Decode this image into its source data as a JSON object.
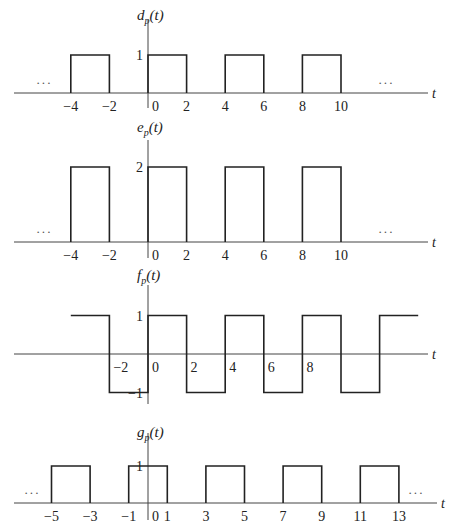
{
  "layout": {
    "origin_x": 148,
    "px_per_unit_x": 19.3
  },
  "plots": [
    {
      "id": "d",
      "ylabel_main": "d",
      "ylabel_sub": "p",
      "ylabel_arg": "(t)",
      "xlabel": "t",
      "axis_y": 93,
      "px_per_unit_y": 38,
      "yaxis_top": 20,
      "yaxis_bottom": 108,
      "xaxis_left": 14,
      "xaxis_right": 428,
      "label_y": 20,
      "ytick_labels": [
        {
          "value": 1,
          "text": "1"
        }
      ],
      "xtick_labels": [
        {
          "value": -4,
          "text": "−4"
        },
        {
          "value": -2,
          "text": "−2"
        },
        {
          "value": 0,
          "text": "0"
        },
        {
          "value": 2,
          "text": "2"
        },
        {
          "value": 4,
          "text": "4"
        },
        {
          "value": 6,
          "text": "6"
        },
        {
          "value": 8,
          "text": "8"
        },
        {
          "value": 10,
          "text": "10"
        }
      ],
      "pulses": [
        [
          -4,
          -2
        ],
        [
          0,
          2
        ],
        [
          4,
          6
        ],
        [
          8,
          10
        ]
      ],
      "amplitude": 1,
      "ellipsis_left": {
        "x": 36,
        "text": "···"
      },
      "ellipsis_right": {
        "x": 378,
        "text": "···"
      }
    },
    {
      "id": "e",
      "ylabel_main": "e",
      "ylabel_sub": "p",
      "ylabel_arg": "(t)",
      "xlabel": "t",
      "axis_y": 242,
      "px_per_unit_y": 37.5,
      "yaxis_top": 140,
      "yaxis_bottom": 258,
      "xaxis_left": 14,
      "xaxis_right": 428,
      "label_y": 132,
      "ytick_labels": [
        {
          "value": 2,
          "text": "2"
        }
      ],
      "xtick_labels": [
        {
          "value": -4,
          "text": "−4"
        },
        {
          "value": -2,
          "text": "−2"
        },
        {
          "value": 0,
          "text": "0"
        },
        {
          "value": 2,
          "text": "2"
        },
        {
          "value": 4,
          "text": "4"
        },
        {
          "value": 6,
          "text": "6"
        },
        {
          "value": 8,
          "text": "8"
        },
        {
          "value": 10,
          "text": "10"
        }
      ],
      "pulses": [
        [
          -4,
          -2
        ],
        [
          0,
          2
        ],
        [
          4,
          6
        ],
        [
          8,
          10
        ]
      ],
      "amplitude": 2,
      "ellipsis_left": {
        "x": 36,
        "text": "···"
      },
      "ellipsis_right": {
        "x": 378,
        "text": "···"
      }
    },
    {
      "id": "f",
      "ylabel_main": "f",
      "ylabel_sub": "p",
      "ylabel_arg": "(t)",
      "xlabel": "t",
      "axis_y": 354,
      "px_per_unit_y": 38.5,
      "yaxis_top": 285,
      "yaxis_bottom": 404,
      "xaxis_left": 14,
      "xaxis_right": 428,
      "label_y": 280,
      "ytick_labels": [
        {
          "value": 1,
          "text": "1"
        },
        {
          "value": -1,
          "text": "−1"
        }
      ],
      "xtick_labels": [
        {
          "value": -2,
          "text": "−2"
        },
        {
          "value": 0,
          "text": "0"
        },
        {
          "value": 2,
          "text": "2"
        },
        {
          "value": 4,
          "text": "4"
        },
        {
          "value": 6,
          "text": "6"
        },
        {
          "value": 8,
          "text": "8"
        }
      ],
      "square_wave": {
        "start": -4,
        "end": 14,
        "period": 4,
        "high": 1,
        "low": -1,
        "high_first_interval": [
          -4,
          -2
        ]
      },
      "ellipsis_left": null,
      "ellipsis_right": null
    },
    {
      "id": "g",
      "ylabel_main": "g",
      "ylabel_sub": "p",
      "ylabel_arg": "(t)",
      "xlabel": "t",
      "axis_y": 503,
      "px_per_unit_y": 37,
      "yaxis_top": 433,
      "yaxis_bottom": 520,
      "xaxis_left": 14,
      "xaxis_right": 437,
      "label_y": 437,
      "ytick_labels": [
        {
          "value": 1,
          "text": "1"
        }
      ],
      "xtick_labels": [
        {
          "value": -5,
          "text": "−5"
        },
        {
          "value": -3,
          "text": "−3"
        },
        {
          "value": -1,
          "text": "−1"
        },
        {
          "value": 0,
          "text": "0"
        },
        {
          "value": 1,
          "text": "1"
        },
        {
          "value": 3,
          "text": "3"
        },
        {
          "value": 5,
          "text": "5"
        },
        {
          "value": 7,
          "text": "7"
        },
        {
          "value": 9,
          "text": "9"
        },
        {
          "value": 11,
          "text": "11"
        },
        {
          "value": 13,
          "text": "13"
        }
      ],
      "pulses": [
        [
          -5,
          -3
        ],
        [
          -1,
          1
        ],
        [
          3,
          5
        ],
        [
          7,
          9
        ],
        [
          11,
          13
        ]
      ],
      "amplitude": 1,
      "ellipsis_left": {
        "x": 24,
        "text": "···"
      },
      "ellipsis_right": {
        "x": 408,
        "text": "···"
      }
    }
  ]
}
